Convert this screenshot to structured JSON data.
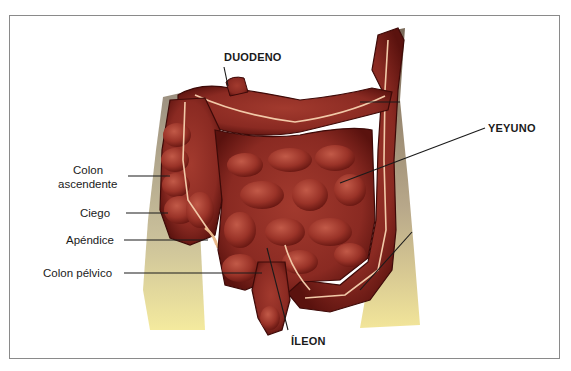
{
  "figure": {
    "colors": {
      "frame": "#8a8a8a",
      "intestine_dark": "#5a0f0c",
      "intestine_mid": "#8e2a22",
      "intestine_light": "#b94a3a",
      "mesentery_vessel": "#f2c9a8",
      "body_shadow": "#a89a88",
      "body_light": "#f3e9a8",
      "leader_line": "#1a1a1a"
    },
    "labels": {
      "duodeno": "DUODENO",
      "yeyuno": "YEYUNO",
      "colon_ascendente_1": "Colon",
      "colon_ascendente_2": "ascendente",
      "ciego": "Ciego",
      "apendice": "Apéndice",
      "colon_pelvico": "Colon pélvico",
      "ileon": "ÍLEON"
    }
  }
}
